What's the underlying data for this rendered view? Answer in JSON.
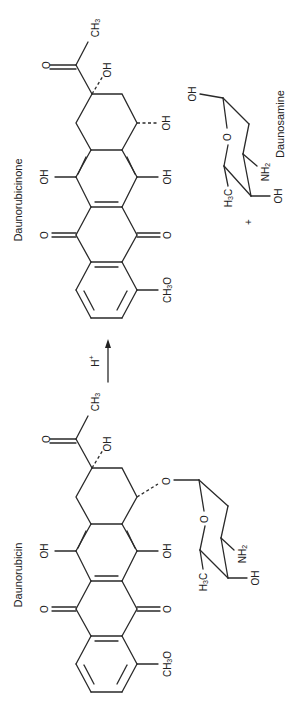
{
  "diagram": {
    "type": "chemical-reaction",
    "orientation": "rotated 90 degrees clockwise",
    "reactant": {
      "name": "Daunorubicin",
      "labels": {
        "ketone_o": "O",
        "methyl": "CH3",
        "c9_oh": "OH",
        "c6_oh": "OH",
        "c11_oh": "OH",
        "quinone_o1": "O",
        "quinone_o2": "O",
        "methoxy": "CH3O",
        "glycosidic_o": "O",
        "ring_o": "O",
        "sugar_methyl": "H3C",
        "amine": "NH2",
        "sugar_oh": "OH"
      }
    },
    "reagent": {
      "label": "H+",
      "arrow": "forward"
    },
    "products": [
      {
        "name": "Daunorubicinone",
        "labels": {
          "ketone_o": "O",
          "methyl": "CH3",
          "c9_oh": "OH",
          "c7_oh": "OH",
          "c6_oh": "OH",
          "c11_oh": "OH",
          "quinone_o1": "O",
          "quinone_o2": "O",
          "methoxy": "CH3O"
        }
      },
      {
        "name": "Daunosamine",
        "labels": {
          "anomeric_oh": "OH",
          "ring_o": "O",
          "sugar_methyl": "H3C",
          "amine": "NH2",
          "sugar_oh": "OH"
        }
      }
    ],
    "plus_sign": "+"
  }
}
